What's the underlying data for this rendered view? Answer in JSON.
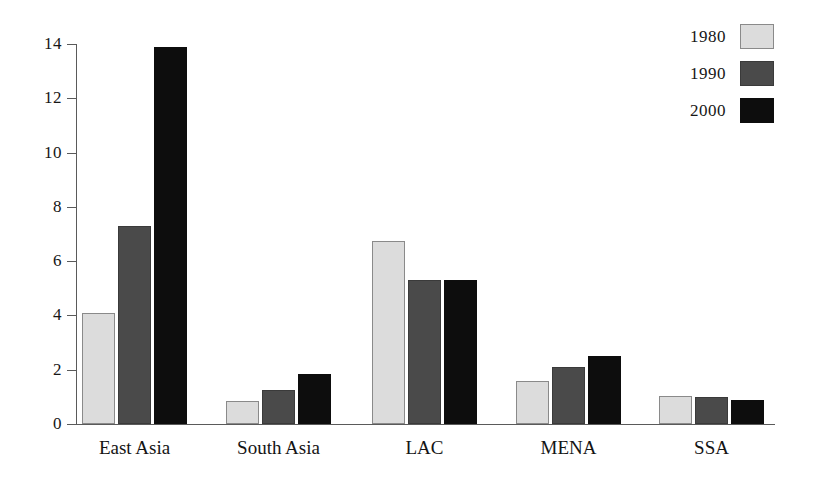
{
  "chart_data": {
    "type": "bar",
    "title": "",
    "subtitle": "",
    "xlabel": "",
    "ylabel": "",
    "categories": [
      "East Asia",
      "South Asia",
      "LAC",
      "MENA",
      "SSA"
    ],
    "series": [
      {
        "name": "1980",
        "color": "#dcdcdc",
        "values": [
          4.1,
          0.85,
          6.75,
          1.6,
          1.05
        ]
      },
      {
        "name": "1990",
        "color": "#4a4a4a",
        "values": [
          7.3,
          1.25,
          5.3,
          2.1,
          1.0
        ]
      },
      {
        "name": "2000",
        "color": "#0d0d0d",
        "values": [
          13.9,
          1.85,
          5.3,
          2.5,
          0.9
        ]
      }
    ],
    "ylim": [
      0,
      14
    ],
    "yticks": [
      0,
      2,
      4,
      6,
      8,
      10,
      12,
      14
    ],
    "ytick_labels": [
      "0",
      "2",
      "4",
      "6",
      "8",
      "10",
      "12",
      "14"
    ],
    "grid": false,
    "legend_position": "top-right",
    "legend_label_side": "left"
  },
  "axis": {
    "y_tick_labels": [
      "14",
      "12",
      "10",
      "8",
      "6",
      "4",
      "2",
      "0"
    ]
  },
  "legend": {
    "entries": [
      {
        "label": "1980"
      },
      {
        "label": "1990"
      },
      {
        "label": "2000"
      }
    ]
  }
}
